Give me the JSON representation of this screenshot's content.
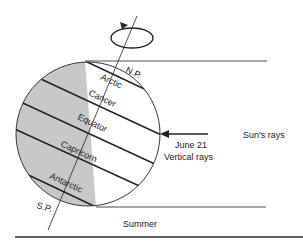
{
  "diagram": {
    "title": "Summer",
    "labels": {
      "north_pole": "N.P.",
      "south_pole": "S.P.",
      "arctic": "Arctic",
      "cancer": "Cancer",
      "equator": "Equator",
      "capricorn": "Capricorn",
      "antarctic": "Antarctic",
      "date": "June 21",
      "vertical_rays": "Vertical rays",
      "sun_rays": "Sun's rays"
    },
    "colors": {
      "night_shade": "#c8c8c8",
      "line": "#222222"
    }
  }
}
